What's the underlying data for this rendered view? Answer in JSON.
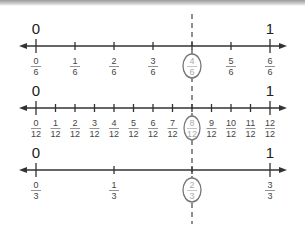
{
  "diagram": {
    "highlight_position": "2/3",
    "colors": {
      "line": "#333333",
      "dashed": "#555555",
      "circle": "#777777",
      "highlight_text": "#aaaaaa"
    },
    "number_lines": [
      {
        "denominator": 6,
        "start_label": "0",
        "end_label": "1",
        "fractions": [
          {
            "num": "0",
            "den": "6"
          },
          {
            "num": "1",
            "den": "6"
          },
          {
            "num": "2",
            "den": "6"
          },
          {
            "num": "3",
            "den": "6"
          },
          {
            "num": "4",
            "den": "6",
            "highlighted": true
          },
          {
            "num": "5",
            "den": "6"
          },
          {
            "num": "6",
            "den": "6"
          }
        ]
      },
      {
        "denominator": 12,
        "start_label": "0",
        "end_label": "1",
        "fractions": [
          {
            "num": "0",
            "den": "12"
          },
          {
            "num": "1",
            "den": "12"
          },
          {
            "num": "2",
            "den": "12"
          },
          {
            "num": "3",
            "den": "12"
          },
          {
            "num": "4",
            "den": "12"
          },
          {
            "num": "5",
            "den": "12"
          },
          {
            "num": "6",
            "den": "12"
          },
          {
            "num": "7",
            "den": "12"
          },
          {
            "num": "8",
            "den": "12",
            "highlighted": true
          },
          {
            "num": "9",
            "den": "12"
          },
          {
            "num": "10",
            "den": "12"
          },
          {
            "num": "11",
            "den": "12"
          },
          {
            "num": "12",
            "den": "12"
          }
        ]
      },
      {
        "denominator": 3,
        "start_label": "0",
        "end_label": "1",
        "fractions": [
          {
            "num": "0",
            "den": "3"
          },
          {
            "num": "1",
            "den": "3"
          },
          {
            "num": "2",
            "den": "3",
            "highlighted": true
          },
          {
            "num": "3",
            "den": "3"
          }
        ]
      }
    ]
  }
}
